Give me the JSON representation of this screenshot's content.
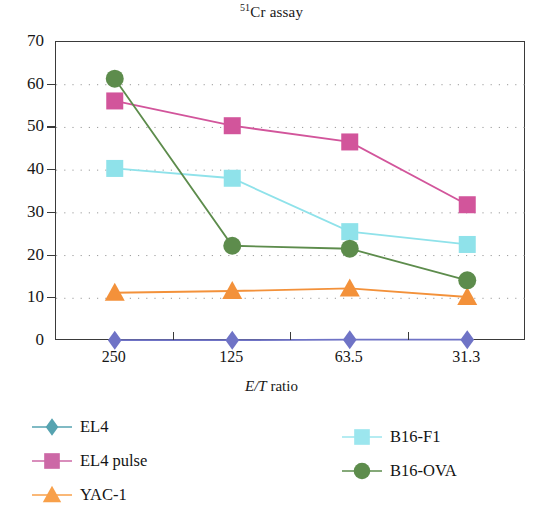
{
  "chart_data": {
    "type": "line",
    "title": "51Cr assay",
    "title_superscript": "51",
    "title_main": "Cr assay",
    "xlabel": "E/T ratio",
    "xlabel_italic_part": "E/T",
    "xlabel_rest": " ratio",
    "ylabel": "",
    "categories": [
      "250",
      "125",
      "63.5",
      "31.3"
    ],
    "ylim": [
      0,
      70
    ],
    "yticks": [
      0,
      10,
      20,
      30,
      40,
      50,
      60,
      70
    ],
    "ytick_labels": [
      "0",
      "10",
      "20",
      "30",
      "40",
      "50",
      "60",
      "70"
    ],
    "grid": "horizontal-dotted",
    "legend_position": "below-plot-two-columns",
    "series": [
      {
        "name": "EL4",
        "values": [
          0.2,
          0.2,
          0.3,
          0.3
        ],
        "color": "#6f73c6",
        "legend_color": "#56a3b0",
        "marker": "diamond"
      },
      {
        "name": "EL4 pulse",
        "values": [
          56.2,
          50.4,
          46.6,
          31.9
        ],
        "color": "#d2559b",
        "legend_color": "#cc68a6",
        "marker": "square"
      },
      {
        "name": "YAC-1",
        "values": [
          11.3,
          11.7,
          12.3,
          10.3
        ],
        "color": "#f3913a",
        "legend_color": "#f8a04a",
        "marker": "triangle"
      },
      {
        "name": "B16-F1",
        "values": [
          40.4,
          38.1,
          25.6,
          22.6
        ],
        "color": "#8fe2ea",
        "legend_color": "#9ce6ee",
        "marker": "square"
      },
      {
        "name": "B16-OVA",
        "values": [
          61.4,
          22.3,
          21.6,
          14.2
        ],
        "color": "#5d8c4c",
        "legend_color": "#5d8c4c",
        "marker": "circle"
      }
    ]
  },
  "axis": {
    "y_labels": [
      "70",
      "60",
      "50",
      "40",
      "30",
      "20",
      "10",
      "0"
    ],
    "x_labels": [
      "250",
      "125",
      "63.5",
      "31.3"
    ]
  },
  "legend": {
    "items": [
      {
        "label": "EL4",
        "column": "left",
        "row": 0
      },
      {
        "label": "EL4 pulse",
        "column": "left",
        "row": 1
      },
      {
        "label": "YAC-1",
        "column": "left",
        "row": 2
      },
      {
        "label": "B16-F1",
        "column": "right",
        "row": 0
      },
      {
        "label": "B16-OVA",
        "column": "right",
        "row": 1
      }
    ]
  }
}
